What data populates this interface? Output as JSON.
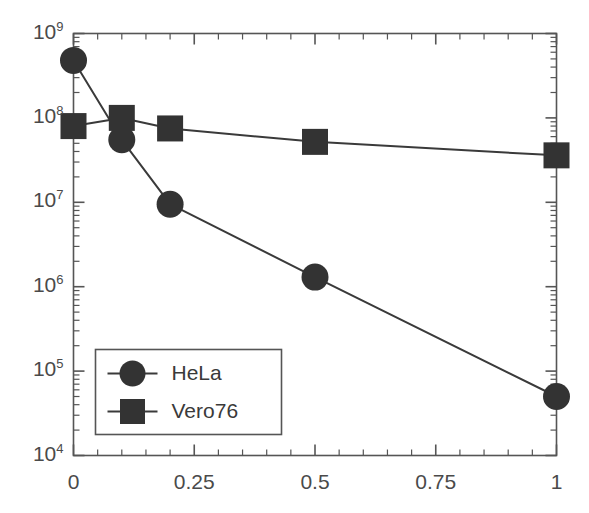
{
  "chart_data": {
    "type": "line",
    "title": "",
    "xlabel": "",
    "ylabel": "",
    "x": [
      0,
      0.1,
      0.2,
      0.5,
      1
    ],
    "series": [
      {
        "name": "HeLa",
        "marker": "circle",
        "values": [
          480000000,
          55000000,
          9500000,
          1300000,
          50000
        ]
      },
      {
        "name": "Vero76",
        "marker": "square",
        "values": [
          80000000,
          100000000,
          75000000,
          52000000,
          36000000
        ]
      }
    ],
    "xlim": [
      0,
      1
    ],
    "ylim": [
      10000,
      1000000000
    ],
    "yscale": "log",
    "xscale": "linear",
    "grid": false,
    "legend_position": "lower-left",
    "marker_color": "#333333",
    "line_color": "#3a3a3a",
    "axis_color": "#555555"
  },
  "axes": {
    "y_tick_labels": [
      {
        "mantissa": "10",
        "exponent": "9",
        "value": 1000000000
      },
      {
        "mantissa": "10",
        "exponent": "8",
        "value": 100000000
      },
      {
        "mantissa": "10",
        "exponent": "7",
        "value": 10000000
      },
      {
        "mantissa": "10",
        "exponent": "6",
        "value": 1000000
      },
      {
        "mantissa": "10",
        "exponent": "5",
        "value": 100000
      },
      {
        "mantissa": "10",
        "exponent": "4",
        "value": 10000
      }
    ],
    "x_tick_labels": [
      {
        "label": "0",
        "value": 0
      },
      {
        "label": "0.25",
        "value": 0.25
      },
      {
        "label": "0.5",
        "value": 0.5
      },
      {
        "label": "0.75",
        "value": 0.75
      },
      {
        "label": "1",
        "value": 1
      }
    ],
    "x_minor_step": 0.05
  },
  "legend": {
    "entries": [
      {
        "label": "HeLa",
        "marker": "circle"
      },
      {
        "label": "Vero76",
        "marker": "square"
      }
    ]
  }
}
